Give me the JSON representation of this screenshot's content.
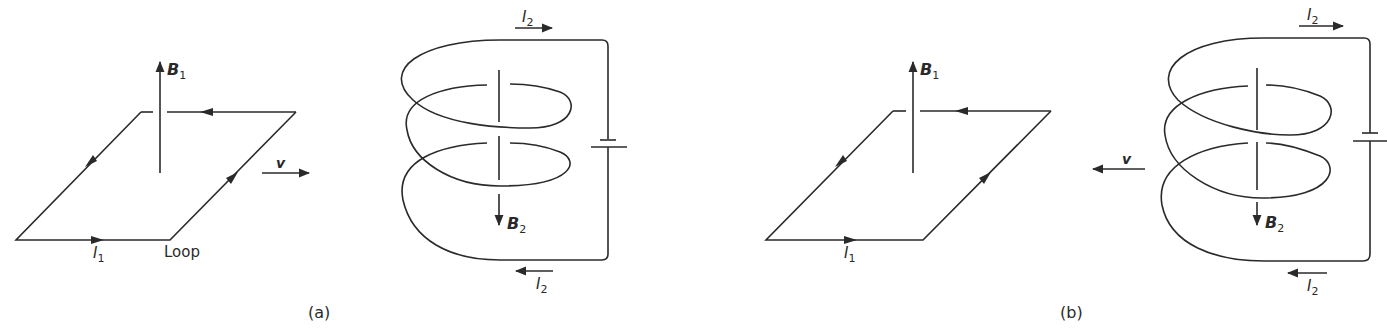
{
  "figure": {
    "panels": [
      {
        "id": "a",
        "caption": "(a)",
        "loop": {
          "label": "Loop",
          "current_label": "I",
          "current_sub": "1",
          "field_label": "B",
          "field_sub": "1"
        },
        "velocity": {
          "label": "v",
          "direction": "right"
        },
        "solenoid": {
          "current_top_label": "I",
          "current_top_sub": "2",
          "current_bottom_label": "I",
          "current_bottom_sub": "2",
          "field_label": "B",
          "field_sub": "2",
          "field_direction": "down"
        }
      },
      {
        "id": "b",
        "caption": "(b)",
        "loop": {
          "current_label": "I",
          "current_sub": "1",
          "field_label": "B",
          "field_sub": "1"
        },
        "velocity": {
          "label": "v",
          "direction": "left"
        },
        "solenoid": {
          "current_top_label": "I",
          "current_top_sub": "2",
          "current_bottom_label": "I",
          "current_bottom_sub": "2",
          "field_label": "B",
          "field_sub": "2",
          "field_direction": "down"
        }
      }
    ],
    "colors": {
      "line": "#2a2a2a",
      "background": "#ffffff"
    }
  }
}
